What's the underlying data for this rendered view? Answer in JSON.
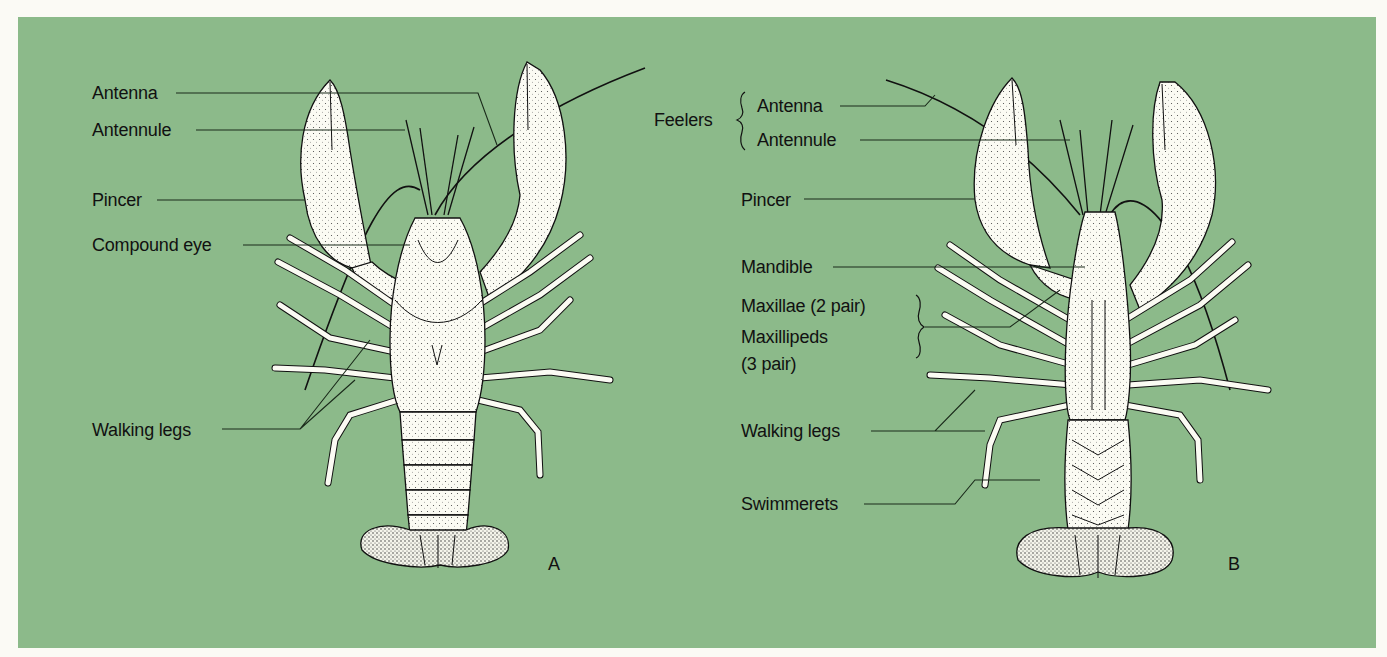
{
  "background_color": "#8cba8a",
  "page_color": "#fbfaf5",
  "figure_a": {
    "view": "dorsal",
    "letter": "A",
    "labels": {
      "antenna": "Antenna",
      "antennule": "Antennule",
      "pincer": "Pincer",
      "compound_eye": "Compound eye",
      "walking_legs": "Walking legs"
    }
  },
  "figure_b": {
    "view": "ventral",
    "letter": "B",
    "labels": {
      "feelers": "Feelers",
      "antenna": "Antenna",
      "antennule": "Antennule",
      "pincer": "Pincer",
      "mandible": "Mandible",
      "maxillae": "Maxillae (2 pair)",
      "maxillipeds_1": "Maxillipeds",
      "maxillipeds_2": "(3 pair)",
      "walking_legs": "Walking legs",
      "swimmerets": "Swimmerets"
    }
  }
}
